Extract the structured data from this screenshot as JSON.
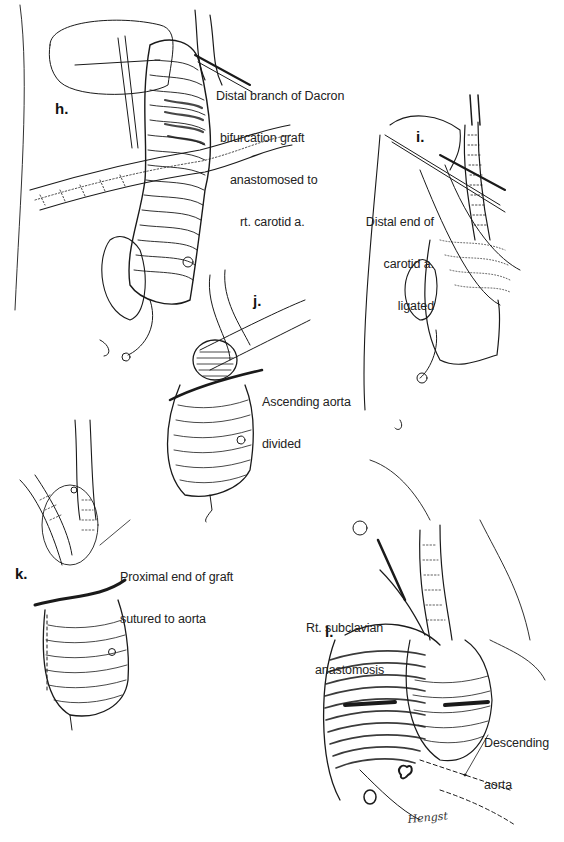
{
  "figure": {
    "type": "surgical-illustration",
    "panels": [
      {
        "id": "h",
        "label": "h.",
        "caption_lines": [
          "Distal branch of Dacron",
          "bifurcation graft",
          "anastomosed to",
          "rt. carotid a."
        ]
      },
      {
        "id": "i",
        "label": "i.",
        "caption_lines": [
          "Distal end of",
          "carotid a.",
          "ligated"
        ]
      },
      {
        "id": "j",
        "label": "j.",
        "caption_lines": [
          "Ascending aorta",
          "divided"
        ]
      },
      {
        "id": "k",
        "label": "k.",
        "caption_lines": [
          "Proximal end of graft",
          "sutured to aorta"
        ]
      },
      {
        "id": "l",
        "label": "l.",
        "caption_lines": [
          "Rt. subclavian",
          "anastomosis"
        ],
        "secondary_caption_lines": [
          "Descending",
          "aorta"
        ]
      }
    ],
    "signature": "Hengst"
  },
  "colors": {
    "background": "#ffffff",
    "ink": "#1a1a1a"
  }
}
